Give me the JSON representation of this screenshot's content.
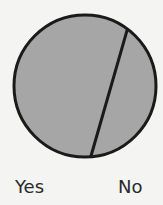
{
  "chart_data": {
    "type": "pie",
    "style": "single-circle-divided-by-chord",
    "title": "",
    "categories": [
      "Yes",
      "No"
    ],
    "values": [
      72,
      28
    ],
    "units": "percent (estimated from chord geometry)",
    "colors": {
      "fill": "#a6a6a6",
      "stroke": "#1a1a1a",
      "background": "#f4f4f2"
    },
    "legend": "bottom",
    "labels": [
      {
        "text": "Yes",
        "position": "bottom-left"
      },
      {
        "text": "No",
        "position": "bottom-right"
      }
    ]
  }
}
